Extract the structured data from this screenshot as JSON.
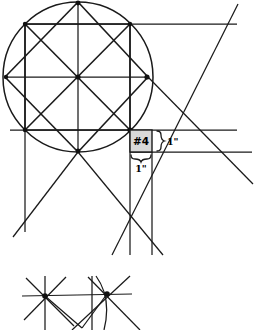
{
  "document": {
    "kind": "geometric-construction-drawing",
    "background_color": "#ffffff",
    "line_color": "#1a1a1a",
    "width": 257,
    "height": 329
  },
  "callout": {
    "label": "#4",
    "fill_color": "#d9d9d9",
    "box": {
      "x": 130,
      "y": 130,
      "w": 22,
      "h": 22
    }
  },
  "dimensions": {
    "vertical_label": "1\"",
    "horizontal_label": "1\"",
    "vertical_brace": {
      "x": 156,
      "y_top": 130,
      "y_bottom": 152
    },
    "horizontal_brace": {
      "y": 158,
      "x_left": 130,
      "x_right": 152
    }
  },
  "upper_figure": {
    "circle": {
      "cx": 78,
      "cy": 77,
      "r": 75
    },
    "inscribed_square": {
      "corners": [
        [
          25,
          24
        ],
        [
          130,
          24
        ],
        [
          130,
          130
        ],
        [
          25,
          130
        ]
      ]
    },
    "rotated_square": {
      "corners": [
        [
          78,
          2
        ],
        [
          148,
          77
        ],
        [
          78,
          152
        ],
        [
          5,
          77
        ]
      ]
    },
    "center": [
      78,
      77
    ],
    "extended_horizontals": [
      {
        "y": 24,
        "x1": 25,
        "x2": 237
      },
      {
        "y": 77,
        "x1": 5,
        "x2": 148
      },
      {
        "y": 130,
        "x1": 10,
        "x2": 237
      },
      {
        "y": 152,
        "x1": 130,
        "x2": 252
      }
    ],
    "extended_verticals": [
      {
        "x": 25,
        "y1": 24,
        "y2": 232
      },
      {
        "x": 78,
        "y1": 2,
        "y2": 152
      },
      {
        "x": 130,
        "y1": 24,
        "y2": 255
      },
      {
        "x": 152,
        "y1": 152,
        "y2": 255
      }
    ],
    "diagonals": [
      {
        "x1": 25,
        "y1": 24,
        "x2": 130,
        "y2": 130
      },
      {
        "x1": 130,
        "y1": 24,
        "x2": 25,
        "y2": 130
      },
      {
        "x1": 78,
        "y1": 2,
        "x2": 148,
        "y2": 77
      },
      {
        "x1": 148,
        "y1": 77,
        "x2": 78,
        "y2": 152
      },
      {
        "x1": 78,
        "y1": 152,
        "x2": 5,
        "y2": 77
      },
      {
        "x1": 5,
        "y1": 77,
        "x2": 78,
        "y2": 2
      }
    ],
    "long_diagonals": [
      {
        "x1": 118,
        "y1": 255,
        "x2": 237,
        "y2": 4
      },
      {
        "x1": 148,
        "y1": 77,
        "x2": 252,
        "y2": 182
      },
      {
        "x1": 78,
        "y1": 152,
        "x2": 14,
        "y2": 236
      },
      {
        "x1": 78,
        "y1": 152,
        "x2": 160,
        "y2": 255
      }
    ]
  },
  "lower_figure": {
    "star_left": {
      "cx": 45,
      "cy": 296,
      "rays": 6
    },
    "star_right": {
      "cx": 107,
      "cy": 294,
      "rays": 6
    },
    "connector": {
      "x1": 22,
      "y1": 296,
      "x2": 130,
      "y2": 294
    },
    "vee": {
      "x1": 45,
      "y1": 296,
      "apex_x": 82,
      "apex_y": 328,
      "x2": 107,
      "y2": 294
    },
    "arc": {
      "cx": 88,
      "cy": 297,
      "r": 34
    }
  }
}
